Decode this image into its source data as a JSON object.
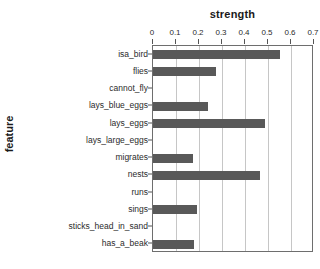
{
  "chart_data": {
    "type": "bar",
    "orientation": "horizontal",
    "title": "strength",
    "xlabel": "strength",
    "ylabel": "feature",
    "xlim": [
      0,
      0.7
    ],
    "xticks": [
      "0",
      "0.1",
      "0.2",
      "0.3",
      "0.4",
      "0.5",
      "0.6",
      "0.7"
    ],
    "xtick_values": [
      0,
      0.1,
      0.2,
      0.3,
      0.4,
      0.5,
      0.6,
      0.7
    ],
    "grid": "vertical",
    "legend": "none",
    "bar_color": "#595959",
    "categories": [
      "isa_bird",
      "flies",
      "cannot_fly",
      "lays_blue_eggs",
      "lays_eggs",
      "lays_large_eggs",
      "migrates",
      "nests",
      "runs",
      "sings",
      "sticks_head_in_sand",
      "has_a_beak"
    ],
    "values": [
      0.55,
      0.275,
      0.0,
      0.24,
      0.485,
      0.0,
      0.175,
      0.465,
      0.0,
      0.19,
      0.0,
      0.18
    ]
  }
}
